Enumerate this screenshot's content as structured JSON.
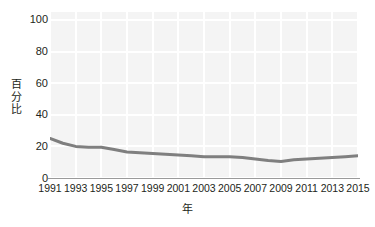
{
  "chart_data": {
    "type": "line",
    "title": "",
    "subtitle": "",
    "xlabel": "年",
    "ylabel": "百分比",
    "ylabel_chars": "百\n分\n比",
    "grid": true,
    "legend": false,
    "legend_position": "none",
    "xlim": [
      1991,
      2015
    ],
    "ylim": [
      0,
      105
    ],
    "yticks": [
      0,
      20,
      40,
      60,
      80,
      100
    ],
    "ytick_labels": [
      "0",
      "20",
      "40",
      "60",
      "80",
      "100"
    ],
    "xticks": [
      1991,
      1993,
      1995,
      1997,
      1999,
      2001,
      2003,
      2005,
      2007,
      2009,
      2011,
      2013,
      2015
    ],
    "xtick_labels": [
      "1991",
      "1993",
      "1995",
      "1997",
      "1999",
      "2001",
      "2003",
      "2005",
      "2007",
      "2009",
      "2011",
      "2013",
      "2015"
    ],
    "x": [
      1991,
      1992,
      1993,
      1994,
      1995,
      1996,
      1997,
      1998,
      1999,
      2000,
      2001,
      2002,
      2003,
      2004,
      2005,
      2006,
      2007,
      2008,
      2009,
      2010,
      2011,
      2012,
      2013,
      2014,
      2015
    ],
    "series": [
      {
        "name": "百分比",
        "color": "#7f7f7f",
        "line_width": 3,
        "values": [
          25,
          22,
          20,
          19.5,
          19.5,
          18,
          16.5,
          16,
          15.5,
          15,
          14.5,
          14,
          13.5,
          13.5,
          13.5,
          13,
          12,
          11,
          10.5,
          11.5,
          12,
          12.5,
          13,
          13.5,
          14
        ]
      }
    ]
  },
  "style": {
    "plot_background": "#f4f4f4",
    "gridline_color": "#ffffff",
    "axis_line_color": "#9a9a9a",
    "text_color": "#231f20",
    "page_background": "#ffffff"
  }
}
